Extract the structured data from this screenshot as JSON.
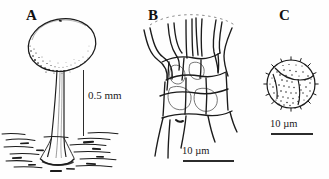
{
  "figure": {
    "type": "scientific-line-drawing-plate",
    "background_color": "#ffffff",
    "ink_color": "#1b1b1b",
    "panel_count": 3
  },
  "panels": [
    {
      "id": "A",
      "label": "A",
      "subject": "stalked-sporangium",
      "description": "ovoid sporangium head on a tapering stalk rooted in hatched substrate",
      "scale": {
        "label": "0.5 mm",
        "value": 0.5,
        "unit": "mm",
        "orientation": "vertical"
      }
    },
    {
      "id": "B",
      "label": "B",
      "subject": "capillitium-net",
      "description": "branching tubular capillitium forming polygonal meshes",
      "scale": {
        "label": "10 µm",
        "value": 10,
        "unit": "µm",
        "orientation": "horizontal"
      }
    },
    {
      "id": "C",
      "label": "C",
      "subject": "spore",
      "description": "globose spore with triradiate mark and dense warted ornamentation",
      "scale": {
        "label": "10 µm",
        "value": 10,
        "unit": "µm",
        "orientation": "horizontal"
      }
    }
  ]
}
